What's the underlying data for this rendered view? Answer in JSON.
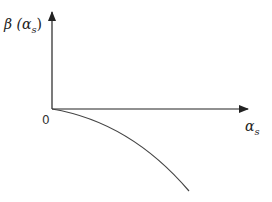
{
  "diagram": {
    "y_axis_label": "β (α",
    "y_axis_label_sub": "s",
    "y_axis_label_close": ")",
    "x_axis_label": "α",
    "x_axis_label_sub": "s",
    "origin_label": "0",
    "curve": "monotonically decreasing, concave-down curve starting at origin",
    "colors": {
      "axis": "#222222",
      "curve": "#444444"
    }
  }
}
